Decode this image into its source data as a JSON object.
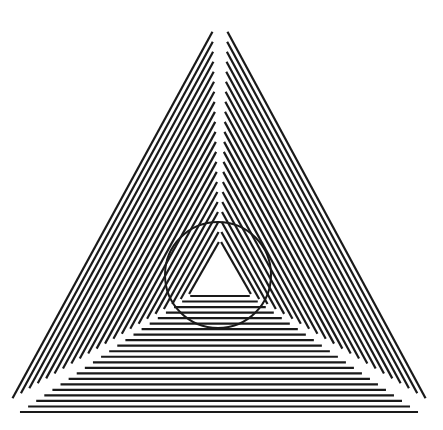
{
  "title": "Triangle line-grating illusion with circle",
  "colors": {
    "background": "#ffffff",
    "ink": "#1a1a1a"
  },
  "figure": {
    "outer_triangle": {
      "apex": [
        220,
        18
      ],
      "bottom_left": [
        5,
        412
      ],
      "bottom_right": [
        433,
        412
      ]
    },
    "inner_triangle": {
      "apex": [
        220,
        240
      ],
      "bottom_left": [
        188,
        296
      ],
      "bottom_right": [
        252,
        296
      ]
    },
    "circle": {
      "cx": 218,
      "cy": 275,
      "r": 53,
      "stroke_width": 2
    },
    "line_count_per_region": 22,
    "line_width": 2.2,
    "regions": [
      "left-sector",
      "right-sector",
      "bottom-sector"
    ]
  }
}
